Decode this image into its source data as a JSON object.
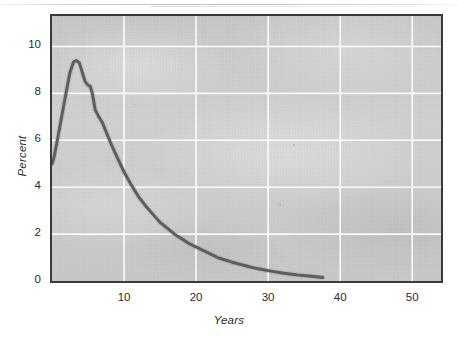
{
  "chart_data": {
    "type": "line",
    "title": "",
    "subtitle": "",
    "xlabel": "Years",
    "ylabel": "Percent",
    "xlim": [
      0,
      54
    ],
    "ylim": [
      0,
      11.3
    ],
    "grid": true,
    "legend": null,
    "legend_position": "none",
    "xticks": [
      10,
      20,
      30,
      40,
      50
    ],
    "xtick_labels": [
      "10",
      "20",
      "30",
      "40",
      "50"
    ],
    "yticks": [
      0,
      2,
      4,
      6,
      8,
      10
    ],
    "ytick_labels": [
      "0",
      "2",
      "4",
      "6",
      "8",
      "10"
    ],
    "series": [
      {
        "name": "Percent",
        "color": "#5d5d5d",
        "x": [
          0.0,
          0.3,
          0.8,
          1.4,
          2.0,
          2.5,
          3.0,
          3.4,
          3.8,
          4.2,
          4.6,
          5.0,
          5.3,
          5.6,
          6.0,
          6.5,
          7.0,
          7.6,
          8.2,
          9.0,
          10.0,
          11.0,
          12.0,
          13.0,
          14.0,
          15.0,
          16.0,
          17.0,
          18.0,
          19.0,
          20.0,
          21.0,
          22.0,
          23.0,
          24.0,
          25.0,
          26.0,
          27.0,
          28.0,
          29.0,
          30.0,
          31.0,
          32.0,
          33.0,
          34.0,
          35.0,
          36.0,
          37.0,
          37.6
        ],
        "y": [
          5.0,
          5.3,
          6.1,
          7.1,
          8.1,
          8.9,
          9.35,
          9.4,
          9.3,
          8.9,
          8.5,
          8.35,
          8.3,
          8.0,
          7.3,
          7.0,
          6.75,
          6.3,
          5.85,
          5.3,
          4.65,
          4.1,
          3.6,
          3.2,
          2.85,
          2.5,
          2.25,
          2.0,
          1.8,
          1.6,
          1.45,
          1.3,
          1.15,
          1.0,
          0.9,
          0.8,
          0.72,
          0.64,
          0.56,
          0.5,
          0.44,
          0.39,
          0.34,
          0.3,
          0.26,
          0.23,
          0.2,
          0.17,
          0.15
        ]
      }
    ],
    "annotations": [],
    "peak": {
      "x": 3.4,
      "y": 9.4
    },
    "start": {
      "x": 0.0,
      "y": 5.0
    },
    "end": {
      "x": 37.6,
      "y": 0.15
    }
  },
  "axes": {
    "y_title": "Percent",
    "x_title": "Years",
    "y_tick_labels": [
      "10",
      "8",
      "6",
      "4",
      "2",
      "0"
    ],
    "x_tick_labels": [
      "10",
      "20",
      "30",
      "40",
      "50"
    ]
  },
  "style": {
    "panel_background": "#cfcfcf",
    "gridline_color": "#ffffff",
    "frame_color": "#3a3a3a",
    "line_color": "#5d5d5d",
    "text_color": "#2b2b2b",
    "page_background": "#ffffff"
  }
}
